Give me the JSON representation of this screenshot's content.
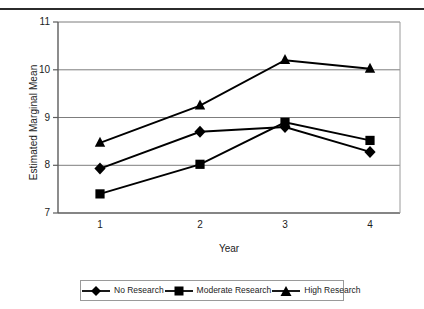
{
  "chart_data": {
    "type": "line",
    "title": "",
    "xlabel": "Year",
    "ylabel": "Estimated Marginal Mean",
    "categories": [
      "1",
      "2",
      "3",
      "4"
    ],
    "x": [
      1,
      2,
      3,
      4
    ],
    "xlim": [
      0.5,
      4.5
    ],
    "ylim": [
      7,
      11
    ],
    "y_ticks": [
      "7",
      "8",
      "9",
      "10",
      "11"
    ],
    "y_tick_values": [
      7,
      8,
      9,
      10,
      11
    ],
    "x_ticks": [
      "1",
      "2",
      "3",
      "4"
    ],
    "grid": "horizontal",
    "legend_position": "bottom",
    "series": [
      {
        "name": "No Research",
        "marker": "diamond",
        "color": "#000000",
        "values": [
          7.93,
          8.7,
          8.8,
          8.28
        ]
      },
      {
        "name": "Moderate Research",
        "marker": "square",
        "color": "#000000",
        "values": [
          7.4,
          8.02,
          8.9,
          8.52
        ]
      },
      {
        "name": "High Research",
        "marker": "triangle",
        "color": "#000000",
        "values": [
          8.47,
          9.25,
          10.2,
          10.02
        ]
      }
    ]
  },
  "axes": {
    "y_label": "Estimated Marginal Mean",
    "x_label": "Year",
    "y_ticks": [
      "11",
      "10",
      "9",
      "8",
      "7"
    ],
    "x_ticks": [
      "1",
      "2",
      "3",
      "4"
    ]
  },
  "legend": {
    "items": [
      {
        "label": "No Research",
        "marker": "diamond-marker"
      },
      {
        "label": "Moderate Research",
        "marker": "square-marker"
      },
      {
        "label": "High Research",
        "marker": "triangle-marker"
      }
    ]
  },
  "colors": {
    "line": "#000000",
    "grid": "#808080",
    "axis": "#6e6e6e",
    "rule": "#2b2b2b"
  }
}
